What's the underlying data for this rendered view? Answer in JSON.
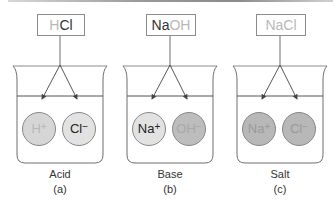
{
  "figure": {
    "panels": [
      {
        "id": "a",
        "formula_parts": [
          {
            "text": "H",
            "shade": "light"
          },
          {
            "text": "Cl",
            "shade": "dark"
          }
        ],
        "ions": [
          {
            "symbol": "H",
            "charge": "+",
            "fill": "#d6d6d6",
            "text_color": "#b8b8b8"
          },
          {
            "symbol": "Cl",
            "charge": "−",
            "fill": "#e2e2e2",
            "text_color": "#222222"
          }
        ],
        "type_label": "Acid",
        "letter_label": "(a)"
      },
      {
        "id": "b",
        "formula_parts": [
          {
            "text": "Na",
            "shade": "dark"
          },
          {
            "text": "OH",
            "shade": "light"
          }
        ],
        "ions": [
          {
            "symbol": "Na",
            "charge": "+",
            "fill": "#e2e2e2",
            "text_color": "#222222"
          },
          {
            "symbol": "OH",
            "charge": "−",
            "fill": "#bdbdbd",
            "text_color": "#a8a8a8"
          }
        ],
        "type_label": "Base",
        "letter_label": "(b)"
      },
      {
        "id": "c",
        "formula_parts": [
          {
            "text": "NaCl",
            "shade": "light"
          }
        ],
        "ions": [
          {
            "symbol": "Na",
            "charge": "+",
            "fill": "#b8b8b8",
            "text_color": "#9a9a9a"
          },
          {
            "symbol": "Cl",
            "charge": "−",
            "fill": "#b8b8b8",
            "text_color": "#9a9a9a"
          }
        ],
        "type_label": "Salt",
        "letter_label": "(c)"
      }
    ],
    "colors": {
      "line": "#6e6e6e",
      "box_border": "#8c8c8c",
      "ion_border": "#888888"
    }
  }
}
